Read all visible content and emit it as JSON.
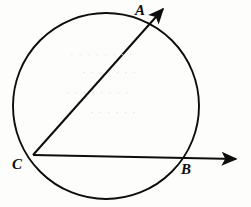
{
  "figure": {
    "background_color": "#fdfdfc",
    "stroke_color": "#0d0d0d",
    "width": 251,
    "height": 207
  },
  "labels": {
    "a": "A",
    "b": "B",
    "c": "C"
  },
  "chart_data": {
    "type": "diagram",
    "xlim": [
      0,
      251
    ],
    "ylim": [
      0,
      207
    ],
    "grid": false,
    "legend": null,
    "shapes": [
      {
        "name": "circle",
        "type": "circle",
        "cx": 106,
        "cy": 106,
        "r": 93,
        "stroke": "#0d0d0d",
        "stroke_width": 2,
        "fill": "none"
      },
      {
        "name": "ray-CA",
        "type": "ray",
        "from": [
          33,
          155
        ],
        "through": [
          152,
          28
        ],
        "tip": [
          167,
          5
        ],
        "arrowhead": true,
        "stroke": "#0d0d0d",
        "stroke_width": 2
      },
      {
        "name": "ray-CB",
        "type": "ray",
        "from": [
          33,
          155
        ],
        "through": [
          183,
          158
        ],
        "tip": [
          243,
          159
        ],
        "arrowhead": true,
        "stroke": "#0d0d0d",
        "stroke_width": 2
      }
    ],
    "points": [
      {
        "name": "A",
        "label": "A",
        "x": 152,
        "y": 28,
        "note": "intersection of ray CA with circle"
      },
      {
        "name": "B",
        "label": "B",
        "x": 183,
        "y": 158,
        "note": "intersection of ray CB with circle"
      },
      {
        "name": "C",
        "label": "C",
        "x": 33,
        "y": 155,
        "note": "common origin of both rays, on circle"
      }
    ],
    "annotations": [
      "Inscribed angle ACB is formed by chords CA and CB",
      "Both rays extend beyond the circle with arrowheads"
    ]
  },
  "artifacts": {
    "rows": [
      {
        "text": "· · · · · · · ·",
        "left": 70,
        "top": 48
      },
      {
        "text": "· · · · · · ·",
        "left": 82,
        "top": 66
      },
      {
        "text": "· · · · · · · ·",
        "left": 66,
        "top": 86
      },
      {
        "text": "· · · · · ·",
        "left": 90,
        "top": 106
      }
    ]
  }
}
